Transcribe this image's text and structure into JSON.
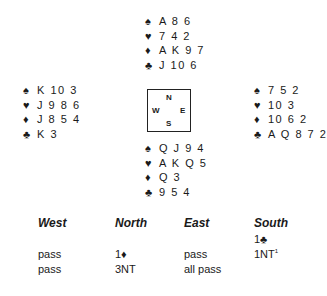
{
  "deal": {
    "north": {
      "spades": "A 8 6",
      "hearts": "7 4 2",
      "diamonds": "A K 9 7",
      "clubs": "J 10 6"
    },
    "west": {
      "spades": "K 10 3",
      "hearts": "J 9 8 6",
      "diamonds": "J 8 5 4",
      "clubs": "K 3"
    },
    "east": {
      "spades": "7 5 2",
      "hearts": "10 3",
      "diamonds": "10 6 2",
      "clubs": "A Q 8 7 2"
    },
    "south": {
      "spades": "Q J 9 4",
      "hearts": "A K Q 5",
      "diamonds": "Q 3",
      "clubs": "9 5 4"
    }
  },
  "suits": {
    "spades": "♠",
    "hearts": "♥",
    "diamonds": "♦",
    "clubs": "♣"
  },
  "compass": {
    "n": "N",
    "s": "S",
    "e": "E",
    "w": "W"
  },
  "auction": {
    "headers": [
      "West",
      "North",
      "East",
      "South"
    ],
    "rows": [
      [
        "",
        "",
        "",
        "1♣"
      ],
      [
        "pass",
        "1♦",
        "pass",
        "1NT"
      ],
      [
        "pass",
        "3NT",
        "all pass",
        ""
      ]
    ],
    "footnote_marker": "1"
  }
}
